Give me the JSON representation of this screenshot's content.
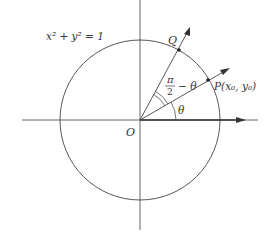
{
  "diagram": {
    "equation": "x² + y² = 1",
    "labels": {
      "origin": "O",
      "point_p": "P(x₀, y₀)",
      "point_q": "Q",
      "angle_theta": "θ",
      "angle_complement_num": "π",
      "angle_complement_den": "2",
      "angle_complement_rest": "− θ"
    },
    "colors": {
      "stroke": "#444444",
      "text": "#333333"
    }
  }
}
